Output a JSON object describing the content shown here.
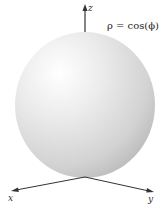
{
  "figure": {
    "formula": "ρ = cos(ϕ)",
    "axes": {
      "x_label": "x",
      "y_label": "y",
      "z_label": "z"
    },
    "colors": {
      "sphere_highlight": "#ffffff",
      "sphere_mid": "#e4e4e4",
      "sphere_shadow": "#b8b8b8",
      "axis": "#333333"
    }
  }
}
